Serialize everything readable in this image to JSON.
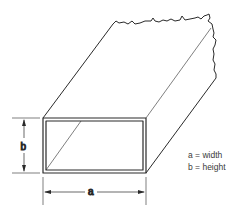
{
  "diagram": {
    "dimension_labels": {
      "a": "a",
      "b": "b"
    },
    "legend": [
      "a = width",
      "b = height"
    ],
    "colors": {
      "line": "#2a2a2a",
      "background": "#ffffff"
    }
  }
}
